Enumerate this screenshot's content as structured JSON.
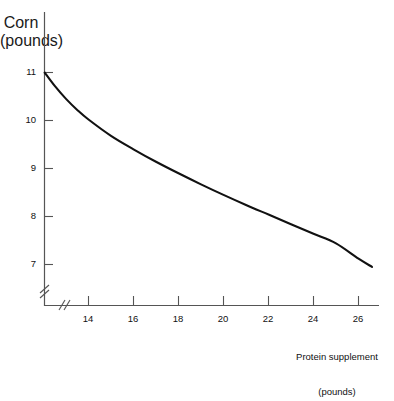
{
  "chart_data": {
    "type": "line",
    "title": "",
    "xlabel": "Protein supplement (pounds)",
    "ylabel": "Corn (pounds)",
    "xlabel_line1": "Protein supplement",
    "xlabel_line2": "(pounds)",
    "ylabel_line1": "Corn",
    "ylabel_line2": "(pounds)",
    "xticks": [
      14,
      16,
      18,
      20,
      22,
      24,
      26
    ],
    "yticks": [
      7,
      8,
      9,
      10,
      11
    ],
    "xtick_labels": [
      "14",
      "16",
      "18",
      "20",
      "22",
      "24",
      "26"
    ],
    "ytick_labels": [
      "7",
      "8",
      "9",
      "10",
      "11"
    ],
    "xlim": [
      12.05,
      27.5
    ],
    "ylim": [
      6.45,
      11.45
    ],
    "grid": false,
    "legend": null,
    "axis_break_x": true,
    "axis_break_y": true,
    "line_color": "#111111",
    "axis_color": "#555555",
    "series": [
      {
        "name": "Corn-protein substitution curve",
        "x": [
          12.05,
          12.5,
          13.0,
          13.5,
          14.0,
          15.0,
          16.0,
          17.0,
          18.0,
          19.0,
          20.0,
          21.0,
          22.0,
          23.0,
          24.0,
          25.0,
          26.0,
          26.6
        ],
        "y": [
          11.0,
          10.72,
          10.45,
          10.22,
          10.02,
          9.68,
          9.4,
          9.14,
          8.9,
          8.67,
          8.45,
          8.24,
          8.04,
          7.84,
          7.64,
          7.44,
          7.12,
          6.95
        ]
      }
    ]
  }
}
